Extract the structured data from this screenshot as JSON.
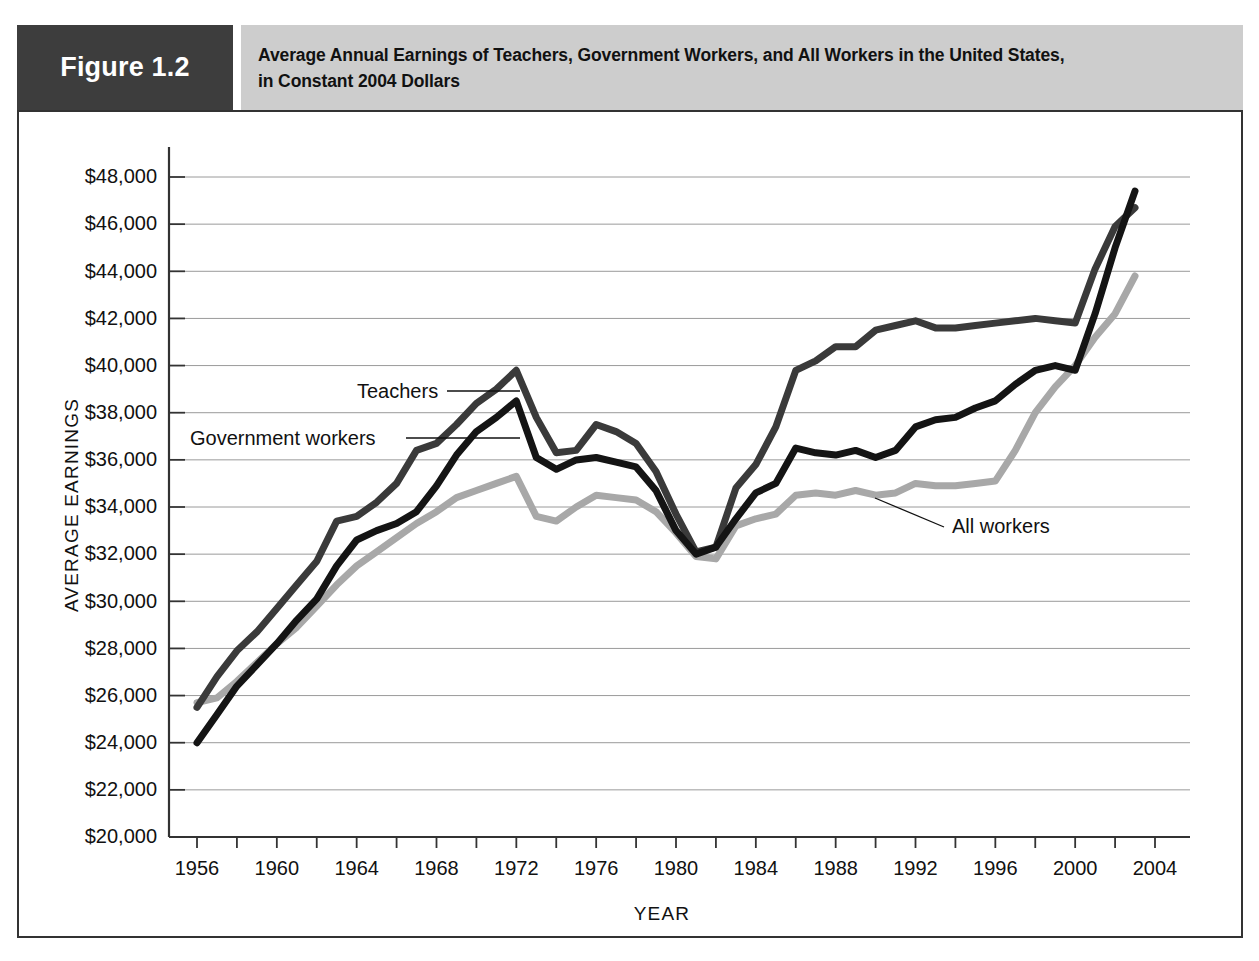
{
  "figure": {
    "number_label": "Figure 1.2",
    "title_line1": "Average Annual Earnings of Teachers, Government Workers, and All Workers in the United States,",
    "title_line2": "in Constant 2004 Dollars"
  },
  "colors": {
    "figure_number_bg": "#3d3d3d",
    "title_bg": "#cdcdcd",
    "frame": "#333333",
    "grid": "#9a9a9a",
    "teachers": "#3a3a3a",
    "government_workers": "#141414",
    "all_workers": "#a8a8a8"
  },
  "annotations": [
    {
      "name": "teachers-label",
      "text": "Teachers"
    },
    {
      "name": "government-workers-label",
      "text": "Government workers"
    },
    {
      "name": "all-workers-label",
      "text": "All workers"
    }
  ],
  "chart_data": {
    "type": "line",
    "title": "Average Annual Earnings of Teachers, Government Workers, and All Workers in the United States, in Constant 2004 Dollars",
    "xlabel": "YEAR",
    "ylabel": "AVERAGE EARNINGS",
    "xlim": [
      1956,
      2004
    ],
    "ylim": [
      20000,
      48000
    ],
    "ytick_step": 2000,
    "xtick_step": 2,
    "xlabel_step": 4,
    "grid": true,
    "legend": "inline-annotations",
    "ytick_labels": [
      "$20,000",
      "$22,000",
      "$24,000",
      "$26,000",
      "$28,000",
      "$30,000",
      "$32,000",
      "$34,000",
      "$36,000",
      "$38,000",
      "$40,000",
      "$42,000",
      "$44,000",
      "$46,000",
      "$48,000"
    ],
    "ytick_values": [
      20000,
      22000,
      24000,
      26000,
      28000,
      30000,
      32000,
      34000,
      36000,
      38000,
      40000,
      42000,
      44000,
      46000,
      48000
    ],
    "xtick_labels": [
      "1956",
      "1960",
      "1964",
      "1968",
      "1972",
      "1976",
      "1980",
      "1984",
      "1988",
      "1992",
      "1996",
      "2000",
      "2004"
    ],
    "xtick_values": [
      1956,
      1960,
      1964,
      1968,
      1972,
      1976,
      1980,
      1984,
      1988,
      1992,
      1996,
      2000,
      2004
    ],
    "x": [
      1956,
      1957,
      1958,
      1959,
      1960,
      1961,
      1962,
      1963,
      1964,
      1965,
      1966,
      1967,
      1968,
      1969,
      1970,
      1971,
      1972,
      1973,
      1974,
      1975,
      1976,
      1977,
      1978,
      1979,
      1980,
      1981,
      1982,
      1983,
      1984,
      1985,
      1986,
      1987,
      1988,
      1989,
      1990,
      1991,
      1992,
      1993,
      1994,
      1995,
      1996,
      1997,
      1998,
      1999,
      2000,
      2001,
      2002,
      2003
    ],
    "series": [
      {
        "name": "Teachers",
        "color": "#3a3a3a",
        "values": [
          25500,
          26800,
          27900,
          28700,
          29700,
          30700,
          31700,
          33400,
          33600,
          34200,
          35000,
          36400,
          36700,
          37500,
          38400,
          39000,
          39800,
          37800,
          36300,
          36400,
          37500,
          37200,
          36700,
          35500,
          33700,
          32100,
          32300,
          34800,
          35800,
          37400,
          39800,
          40200,
          40800,
          40800,
          41500,
          41700,
          41900,
          41600,
          41600,
          41700,
          41800,
          41900,
          42000,
          41900,
          41800,
          44100,
          45900,
          46700
        ]
      },
      {
        "name": "Government workers",
        "color": "#141414",
        "values": [
          24000,
          25200,
          26400,
          27300,
          28200,
          29200,
          30100,
          31500,
          32600,
          33000,
          33300,
          33800,
          34900,
          36200,
          37200,
          37800,
          38500,
          36100,
          35600,
          36000,
          36100,
          35900,
          35700,
          34700,
          33000,
          32000,
          32300,
          33500,
          34600,
          35000,
          36500,
          36300,
          36200,
          36400,
          36100,
          36400,
          37400,
          37700,
          37800,
          38200,
          38500,
          39200,
          39800,
          40000,
          39800,
          42200,
          45000,
          47400
        ]
      },
      {
        "name": "All workers",
        "color": "#a8a8a8",
        "values": [
          25700,
          25900,
          26600,
          27400,
          28200,
          28900,
          29800,
          30700,
          31500,
          32100,
          32700,
          33300,
          33800,
          34400,
          34700,
          35000,
          35300,
          33600,
          33400,
          34000,
          34500,
          34400,
          34300,
          33800,
          32900,
          31900,
          31800,
          33200,
          33500,
          33700,
          34500,
          34600,
          34500,
          34700,
          34500,
          34600,
          35000,
          34900,
          34900,
          35000,
          35100,
          36400,
          38000,
          39100,
          40000,
          41200,
          42200,
          43800
        ]
      }
    ]
  }
}
